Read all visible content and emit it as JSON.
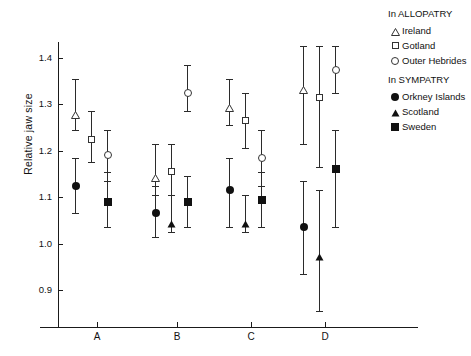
{
  "chart_data": {
    "type": "scatter",
    "title": "",
    "xlabel": "",
    "ylabel": "Relative jaw size",
    "ylim": [
      0.855,
      1.45
    ],
    "yticks": [
      0.9,
      1.0,
      1.1,
      1.2,
      1.3,
      1.4
    ],
    "ytick_labels": [
      "0.9",
      "1.0",
      "1.1",
      "1.2",
      "1.3",
      "1.4"
    ],
    "categories": [
      "A",
      "B",
      "C",
      "D"
    ],
    "grid": false,
    "legend_position": "right",
    "error_bars": "vertical ranges with caps",
    "legend": {
      "groups": [
        {
          "heading": "In ALLOPATRY",
          "entries": [
            {
              "label": "Ireland",
              "marker": "triangle-open"
            },
            {
              "label": "Gotland",
              "marker": "square-open"
            },
            {
              "label": "Outer Hebrides",
              "marker": "circle-open"
            }
          ]
        },
        {
          "heading": "In SYMPATRY",
          "entries": [
            {
              "label": "Orkney Islands",
              "marker": "circle-filled"
            },
            {
              "label": "Scotland",
              "marker": "triangle-filled"
            },
            {
              "label": "Sweden",
              "marker": "square-filled"
            }
          ]
        }
      ]
    },
    "series": [
      {
        "name": "Ireland",
        "marker": "triangle-open",
        "points": [
          {
            "category": "A",
            "value": 1.29,
            "low": 1.245,
            "high": 1.355
          },
          {
            "category": "B",
            "value": 1.155,
            "low": 1.105,
            "high": 1.215
          },
          {
            "category": "C",
            "value": 1.305,
            "low": 1.255,
            "high": 1.355
          },
          {
            "category": "D",
            "value": 1.345,
            "low": 1.215,
            "high": 1.425
          }
        ]
      },
      {
        "name": "Gotland",
        "marker": "square-open",
        "points": [
          {
            "category": "A",
            "value": 1.225,
            "low": 1.175,
            "high": 1.285
          },
          {
            "category": "B",
            "value": 1.155,
            "low": 1.105,
            "high": 1.215
          },
          {
            "category": "C",
            "value": 1.265,
            "low": 1.205,
            "high": 1.325
          },
          {
            "category": "D",
            "value": 1.315,
            "low": 1.165,
            "high": 1.425
          }
        ]
      },
      {
        "name": "Outer Hebrides",
        "marker": "circle-open",
        "points": [
          {
            "category": "A",
            "value": 1.19,
            "low": 1.135,
            "high": 1.245
          },
          {
            "category": "B",
            "value": 1.325,
            "low": 1.285,
            "high": 1.385
          },
          {
            "category": "C",
            "value": 1.185,
            "low": 1.125,
            "high": 1.245
          },
          {
            "category": "D",
            "value": 1.375,
            "low": 1.325,
            "high": 1.425
          }
        ]
      },
      {
        "name": "Orkney Islands",
        "marker": "circle-filled",
        "points": [
          {
            "category": "A",
            "value": 1.125,
            "low": 1.065,
            "high": 1.185
          },
          {
            "category": "B",
            "value": 1.065,
            "low": 1.015,
            "high": 1.125
          },
          {
            "category": "C",
            "value": 1.115,
            "low": 1.035,
            "high": 1.185
          },
          {
            "category": "D",
            "value": 1.035,
            "low": 0.935,
            "high": 1.135
          }
        ]
      },
      {
        "name": "Scotland",
        "marker": "triangle-filled",
        "points": [
          {
            "category": "B",
            "value": 1.055,
            "low": 1.025,
            "high": 1.105
          },
          {
            "category": "C",
            "value": 1.055,
            "low": 1.025,
            "high": 1.105
          },
          {
            "category": "D",
            "value": 0.985,
            "low": 0.855,
            "high": 1.115
          }
        ]
      },
      {
        "name": "Sweden",
        "marker": "square-filled",
        "points": [
          {
            "category": "A",
            "value": 1.09,
            "low": 1.035,
            "high": 1.155
          },
          {
            "category": "B",
            "value": 1.09,
            "low": 1.035,
            "high": 1.145
          },
          {
            "category": "C",
            "value": 1.095,
            "low": 1.035,
            "high": 1.155
          },
          {
            "category": "D",
            "value": 1.16,
            "low": 1.035,
            "high": 1.245
          }
        ]
      }
    ]
  }
}
